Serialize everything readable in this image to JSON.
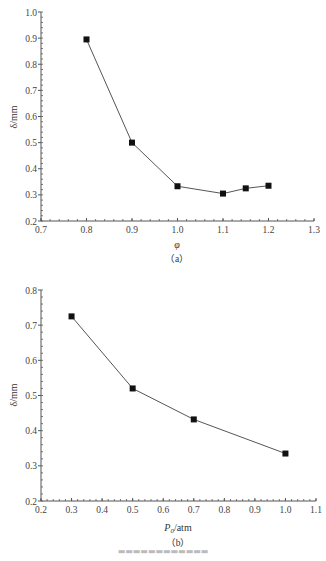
{
  "chart_data": [
    {
      "type": "line",
      "panel": "(a)",
      "title": "",
      "xlabel": "φ",
      "ylabel": "δ/mm",
      "xlim": [
        0.7,
        1.3
      ],
      "ylim": [
        0.2,
        1.0
      ],
      "xticks": [
        "0.7",
        "0.8",
        "0.9",
        "1.0",
        "1.1",
        "1.2",
        "1.3"
      ],
      "yticks": [
        "0.2",
        "0.3",
        "0.4",
        "0.5",
        "0.6",
        "0.7",
        "0.8",
        "0.9",
        "1.0"
      ],
      "grid": false,
      "marker": "square",
      "series": [
        {
          "name": "δ",
          "x": [
            0.8,
            0.9,
            1.0,
            1.1,
            1.15,
            1.2
          ],
          "values": [
            0.895,
            0.5,
            0.333,
            0.305,
            0.325,
            0.335
          ]
        }
      ]
    },
    {
      "type": "line",
      "panel": "(b)",
      "title": "",
      "xlabel": "P0/atm",
      "ylabel": "δ/mm",
      "xlim": [
        0.2,
        1.1
      ],
      "ylim": [
        0.2,
        0.8
      ],
      "xticks": [
        "0.2",
        "0.3",
        "0.4",
        "0.5",
        "0.6",
        "0.7",
        "0.8",
        "0.9",
        "1.0",
        "1.1"
      ],
      "yticks": [
        "0.2",
        "0.3",
        "0.4",
        "0.5",
        "0.6",
        "0.7",
        "0.8"
      ],
      "grid": false,
      "marker": "square",
      "series": [
        {
          "name": "δ",
          "x": [
            0.3,
            0.5,
            0.7,
            1.0
          ],
          "values": [
            0.725,
            0.52,
            0.432,
            0.335
          ]
        }
      ]
    }
  ],
  "labels": {
    "a": {
      "ylabel": "δ/mm",
      "xlabel": "φ",
      "panel": "（a）"
    },
    "b": {
      "ylabel": "δ/mm",
      "xlabel_main": "P",
      "xlabel_sub": "0",
      "xlabel_unit": "/atm",
      "panel": "（b）"
    }
  }
}
